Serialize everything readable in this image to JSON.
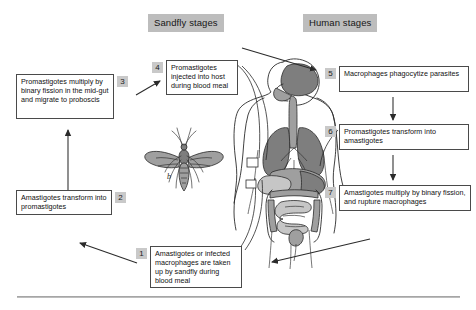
{
  "figure": {
    "caption_rule": true
  },
  "headers": [
    {
      "id": "sandfly",
      "label": "Sandfly stages"
    },
    {
      "id": "human",
      "label": "Human stages"
    }
  ],
  "stages": [
    {
      "number": "1",
      "name": "amastigotes-taken-up",
      "text": "Amastigotes or infected macrophages are taken up by sandfly during blood meal"
    },
    {
      "number": "2",
      "name": "amastigotes-transform",
      "text": "Amastigotes transform into promastigotes"
    },
    {
      "number": "3",
      "name": "promastigotes-multiply-midgut",
      "text": "Promastigotes multiply by binary fission in the mid-gut and migrate to proboscis"
    },
    {
      "number": "4",
      "name": "promastigotes-injected",
      "text": "Promastigotes injected into host during blood meal"
    },
    {
      "number": "5",
      "name": "macrophages-phagocytize",
      "text": "Macrophages phagocytize parasites"
    },
    {
      "number": "6",
      "name": "promastigotes-transform",
      "text": "Promastigotes transform into amastigotes"
    },
    {
      "number": "7",
      "name": "amastigotes-multiply-rupture",
      "text": "Amastigotes multiply by binary fission, and rupture macrophages"
    }
  ],
  "illustrations": {
    "sandfly": {
      "label": "b",
      "name": "sandfly-illustration"
    },
    "human": {
      "label": "",
      "name": "human-torso-illustration"
    }
  },
  "colors": {
    "header_badge": "#bdbdbd",
    "number_badge": "#c9c9c9",
    "box_border": "#4a4a4a",
    "arrow": "#2b2b2b",
    "organ_dark": "#7a7a7a",
    "organ_mid": "#9d9d9d",
    "organ_light": "#c4c4c4",
    "outline": "#2b2b2b"
  }
}
